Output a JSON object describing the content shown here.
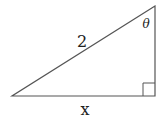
{
  "diagram": {
    "type": "right-triangle",
    "stroke_color": "#555555",
    "vertices": {
      "top": [
        155,
        6
      ],
      "bottom_left": [
        12,
        96
      ],
      "bottom_right": [
        155,
        96
      ]
    },
    "right_angle_marker": {
      "corner": "bottom_right",
      "size": 12
    },
    "labels": {
      "hypotenuse": "2",
      "angle": "θ",
      "base": "x"
    }
  }
}
